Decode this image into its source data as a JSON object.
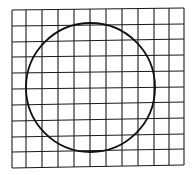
{
  "figure": {
    "grid": {
      "columns": 11,
      "rows": 10,
      "x_lines": [
        12,
        26,
        42,
        58,
        74,
        90,
        106,
        122,
        138,
        154,
        169,
        184
      ],
      "y_lines_left": [
        10,
        26,
        42,
        57,
        73,
        89,
        105,
        121,
        137,
        152,
        168
      ],
      "y_lines_right": [
        8,
        24,
        39,
        55,
        71,
        87,
        102,
        118,
        134,
        149,
        165
      ],
      "line_color": "#1a1a1a"
    },
    "circle": {
      "cx": 90.5,
      "cy": 87.5,
      "r": 64.5,
      "stroke_color": "#111111",
      "stroke_width": 1.8
    }
  }
}
